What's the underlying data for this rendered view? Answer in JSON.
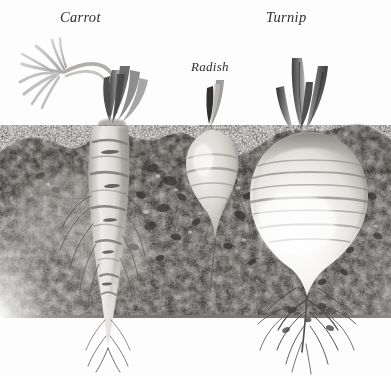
{
  "figure": {
    "kind": "botanical-illustration",
    "palette": {
      "background": "#fdfdfd",
      "label_text": "#2e2e2e",
      "soil_dark": "#55534f",
      "soil_mid": "#8a8884",
      "soil_light": "#b9b6b1",
      "root_body_light": "#e9e7e4",
      "root_body_mid": "#c6c3bf",
      "root_shadow": "#8f8c88",
      "foliage_dark": "#4a4a4a",
      "foliage_mid": "#909090",
      "foliage_light": "#c9c9c9",
      "rootlet": "#5a5856"
    },
    "labels": [
      {
        "id": "carrot",
        "text": "Carrot"
      },
      {
        "id": "radish",
        "text": "Radish"
      },
      {
        "id": "turnip",
        "text": "Turnip"
      }
    ],
    "plants": [
      {
        "name": "Carrot",
        "label": "Carrot",
        "position": "left",
        "root_shape": "long tapering conical taproot",
        "root_banding": "horizontal ring markings",
        "foliage": "feathery fern-like fronds on arching stems",
        "rootlets": "many fine lateral hairs along the taproot"
      },
      {
        "name": "Radish",
        "label": "Radish",
        "position": "center",
        "root_shape": "small rounded bulb tapering to a point",
        "root_banding": "soft horizontal shading",
        "foliage": "two short dark leaf stalks",
        "rootlets": "slender tail root"
      },
      {
        "name": "Turnip",
        "label": "Turnip",
        "position": "right",
        "root_shape": "large round globe bulb",
        "root_banding": "horizontal striations across the globe",
        "foliage": "four thick upright cut leaf stalks",
        "rootlets": "branching fibrous root mass below"
      }
    ],
    "soil": {
      "description": "mottled dark speckled soil band with irregular pebbles",
      "top_edge": "uneven, dipping between plants",
      "fade": "dissolves to white toward the bottom of the image"
    }
  }
}
